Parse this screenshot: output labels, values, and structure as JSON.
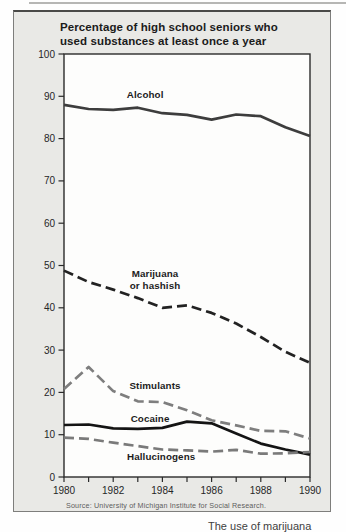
{
  "page": {
    "caption_fragment": "The use of marijuana"
  },
  "chart": {
    "title": "Percentage of high school seniors who used substances at least once a year",
    "title_lines": [
      "Percentage of high school seniors who",
      "used substances at least once a year"
    ],
    "source": "Source: University of Michigan Institute for Social Research."
  },
  "chart_data": {
    "type": "line",
    "title": "Percentage of high school seniors who used substances at least once a year",
    "xlabel": "",
    "ylabel": "",
    "x": [
      1980,
      1981,
      1982,
      1983,
      1984,
      1985,
      1986,
      1987,
      1988,
      1989,
      1990
    ],
    "x_tick_labels": [
      "1980",
      "1982",
      "1984",
      "1986",
      "1988",
      "1990"
    ],
    "y_ticks": [
      0,
      10,
      20,
      30,
      40,
      50,
      60,
      70,
      80,
      90,
      100
    ],
    "ylim": [
      0,
      100
    ],
    "grid": false,
    "legend": "inline-labels",
    "source": "Source: University of Michigan Institute for Social Research.",
    "series": [
      {
        "name": "Alcohol",
        "style": "solid",
        "color": "#3d3d3d",
        "values": [
          88.0,
          87.0,
          86.8,
          87.3,
          86.0,
          85.6,
          84.5,
          85.7,
          85.3,
          82.7,
          80.6
        ],
        "label_pos": {
          "x": 1983.3,
          "y": 89.5
        }
      },
      {
        "name": "Marijuana or hashish",
        "label_lines": [
          "Marijuana",
          "or hashish"
        ],
        "style": "dashed",
        "color": "#222222",
        "values": [
          48.8,
          46.1,
          44.3,
          42.3,
          40.0,
          40.6,
          38.8,
          36.3,
          33.1,
          29.6,
          27.0
        ],
        "label_pos": {
          "x": 1983.7,
          "y": 47.3
        }
      },
      {
        "name": "Stimulants",
        "style": "dashed",
        "color": "#7e7e7e",
        "values": [
          20.8,
          26.0,
          20.3,
          17.9,
          17.7,
          15.8,
          13.4,
          12.2,
          10.9,
          10.8,
          9.1
        ],
        "label_pos": {
          "x": 1983.7,
          "y": 20.9
        }
      },
      {
        "name": "Cocaine",
        "style": "solid",
        "color": "#141414",
        "values": [
          12.3,
          12.4,
          11.5,
          11.4,
          11.6,
          13.1,
          12.7,
          10.3,
          7.9,
          6.5,
          5.3
        ],
        "label_pos": {
          "x": 1983.5,
          "y": 13.0
        }
      },
      {
        "name": "Hallucinogens",
        "style": "dashed",
        "color": "#7a7a7a",
        "values": [
          9.3,
          9.0,
          8.1,
          7.3,
          6.5,
          6.3,
          6.0,
          6.4,
          5.5,
          5.6,
          5.9
        ],
        "label_pos": {
          "x": 1983.95,
          "y": 4.0
        }
      }
    ]
  }
}
